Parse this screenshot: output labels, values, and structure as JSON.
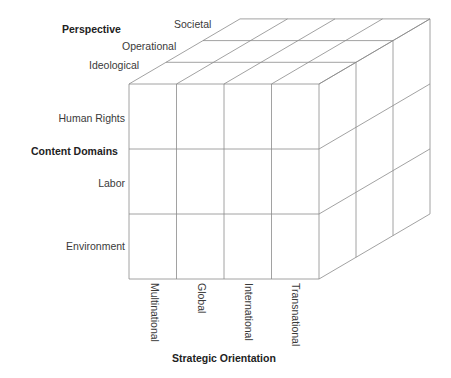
{
  "diagram": {
    "type": "3d-cube-matrix",
    "line_color": "#8a8a8a",
    "axes": {
      "perspective": {
        "title": "Perspective",
        "levels": [
          "Ideological",
          "Operational",
          "Societal"
        ]
      },
      "content_domains": {
        "title": "Content Domains",
        "levels": [
          "Human Rights",
          "Labor",
          "Environment"
        ]
      },
      "strategic_orientation": {
        "title": "Strategic Orientation",
        "levels": [
          "Multinational",
          "Global",
          "International",
          "Transnational"
        ]
      }
    }
  }
}
